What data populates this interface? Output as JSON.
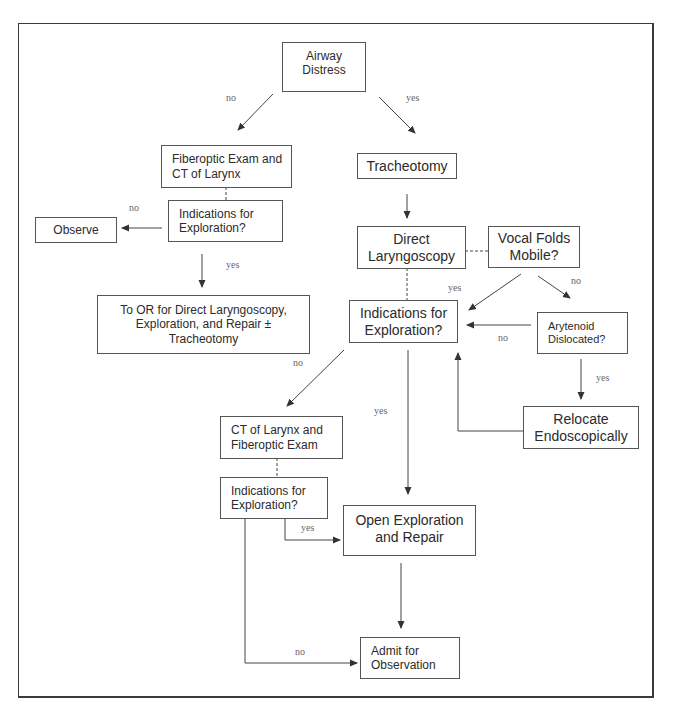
{
  "diagram": {
    "type": "flowchart",
    "nodes": {
      "airway_distress": "Airway\nDistress",
      "fiberoptic_ct": "Fiberoptic Exam and\nCT of Larynx",
      "indications_left": "Indications for\nExploration?",
      "observe": "Observe",
      "to_or": "To OR for Direct Laryngoscopy,\nExploration, and Repair ±\nTracheotomy",
      "tracheotomy": "Tracheotomy",
      "direct_laryngoscopy": "Direct\nLaryngoscopy",
      "vocal_folds": "Vocal Folds\nMobile?",
      "indications_main": "Indications for\nExploration?",
      "arytenoid": "Arytenoid\nDislocated?",
      "relocate": "Relocate\nEndoscopically",
      "ct_fiberoptic": "CT of Larynx and\nFiberoptic Exam",
      "indications_bottom": "Indications for\nExploration?",
      "open_exploration": "Open Exploration\nand Repair",
      "admit": "Admit for\nObservation"
    },
    "labels": {
      "airway_no": "no",
      "airway_yes": "yes",
      "indic_left_no": "no",
      "indic_left_yes": "yes",
      "vocal_yes": "yes",
      "vocal_no": "no",
      "arytenoid_no": "no",
      "arytenoid_yes": "yes",
      "indic_main_no": "no",
      "indic_main_yes": "yes",
      "indic_bottom_yes": "yes",
      "indic_bottom_no": "no"
    },
    "edges": [
      {
        "from": "airway_distress",
        "to": "fiberoptic_ct",
        "label": "no"
      },
      {
        "from": "airway_distress",
        "to": "tracheotomy",
        "label": "yes"
      },
      {
        "from": "fiberoptic_ct",
        "to": "indications_left",
        "style": "dashed"
      },
      {
        "from": "indications_left",
        "to": "observe",
        "label": "no"
      },
      {
        "from": "indications_left",
        "to": "to_or",
        "label": "yes"
      },
      {
        "from": "tracheotomy",
        "to": "direct_laryngoscopy"
      },
      {
        "from": "direct_laryngoscopy",
        "to": "vocal_folds",
        "style": "dashed"
      },
      {
        "from": "direct_laryngoscopy",
        "to": "indications_main",
        "style": "dashed"
      },
      {
        "from": "vocal_folds",
        "to": "indications_main",
        "label": "yes"
      },
      {
        "from": "vocal_folds",
        "to": "arytenoid",
        "label": "no"
      },
      {
        "from": "arytenoid",
        "to": "indications_main",
        "label": "no"
      },
      {
        "from": "arytenoid",
        "to": "relocate",
        "label": "yes"
      },
      {
        "from": "relocate",
        "to": "indications_main"
      },
      {
        "from": "indications_main",
        "to": "ct_fiberoptic",
        "label": "no"
      },
      {
        "from": "indications_main",
        "to": "open_exploration",
        "label": "yes"
      },
      {
        "from": "ct_fiberoptic",
        "to": "indications_bottom",
        "style": "dashed"
      },
      {
        "from": "indications_bottom",
        "to": "open_exploration",
        "label": "yes"
      },
      {
        "from": "indications_bottom",
        "to": "admit",
        "label": "no"
      },
      {
        "from": "open_exploration",
        "to": "admit"
      }
    ]
  }
}
